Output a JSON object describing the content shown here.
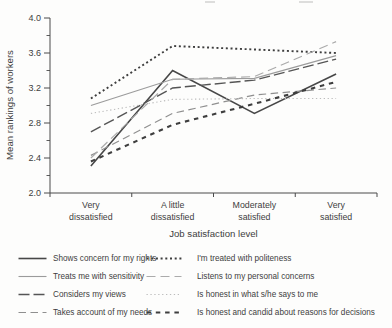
{
  "chart_data": {
    "type": "line",
    "title": "",
    "xlabel": "Job satisfaction level",
    "ylabel": "Mean rankings of workers",
    "ylim": [
      2.0,
      4.0
    ],
    "y_ticks": [
      2.0,
      2.4,
      2.8,
      3.2,
      3.6,
      4.0
    ],
    "y_minor_ticks": [
      2.2,
      2.6,
      3.0,
      3.4,
      3.8
    ],
    "grid": false,
    "legend_position": "bottom-two-columns",
    "categories": [
      "Very dissatisfied",
      "A little dissatisfied",
      "Moderately satisfied",
      "Very satisfied"
    ],
    "series": [
      {
        "name": "Shows concern for my rights",
        "values": [
          2.31,
          3.4,
          2.91,
          3.36
        ],
        "line_style": "solid",
        "line_weight": 1.6,
        "color": "#474747"
      },
      {
        "name": "Treats me with sensitivity",
        "values": [
          3.0,
          3.3,
          3.31,
          3.57
        ],
        "line_style": "solid",
        "line_weight": 1.1,
        "color": "#9b9b9b"
      },
      {
        "name": "Considers my views",
        "values": [
          2.7,
          3.2,
          3.29,
          3.53
        ],
        "line_style": "long-dash",
        "line_weight": 1.4,
        "color": "#555555"
      },
      {
        "name": "Takes account of my needs",
        "values": [
          2.43,
          2.91,
          3.12,
          3.2
        ],
        "line_style": "dash",
        "line_weight": 1.2,
        "color": "#8f8f8f"
      },
      {
        "name": "I'm treated with politeness",
        "values": [
          3.08,
          3.68,
          3.64,
          3.6
        ],
        "line_style": "dotted-bold",
        "line_weight": 1.9,
        "color": "#3e3e3e"
      },
      {
        "name": "Listens to my personal concerns",
        "values": [
          2.4,
          3.3,
          3.33,
          3.73
        ],
        "line_style": "dash-light",
        "line_weight": 1.2,
        "color": "#ababab"
      },
      {
        "name": "Is honest in what s/he says to me",
        "values": [
          2.91,
          3.07,
          3.08,
          3.08
        ],
        "line_style": "dotted-fine",
        "line_weight": 1.1,
        "color": "#bcbcbc"
      },
      {
        "name": "Is honest and candid about reasons for decisions",
        "values": [
          2.36,
          2.78,
          3.02,
          3.27
        ],
        "line_style": "short-dash-bold",
        "line_weight": 2.1,
        "color": "#3e3e3e"
      }
    ]
  },
  "legend": {
    "columns": [
      [
        0,
        1,
        2,
        3
      ],
      [
        4,
        5,
        6,
        7
      ]
    ]
  }
}
